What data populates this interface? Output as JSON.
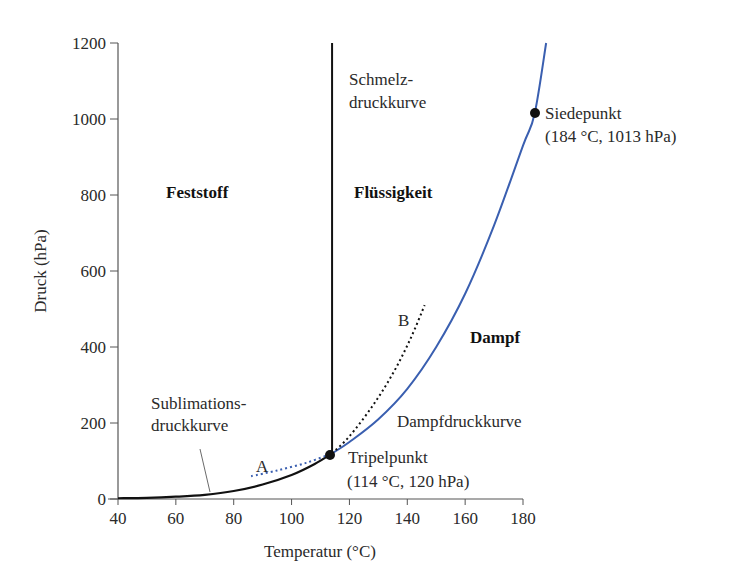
{
  "chart_data": {
    "type": "line",
    "title": "",
    "xlabel": "Temperatur (°C)",
    "ylabel": "Druck (hPa)",
    "xlim": [
      40,
      180
    ],
    "ylim": [
      0,
      1200
    ],
    "xticks": [
      40,
      60,
      80,
      100,
      120,
      140,
      160,
      180
    ],
    "yticks": [
      0,
      200,
      400,
      600,
      800,
      1000,
      1200
    ],
    "grid": false,
    "legend": null,
    "regions": {
      "solid": "Feststoff",
      "liquid": "Flüssigkeit",
      "vapor": "Dampf"
    },
    "series": [
      {
        "name": "Sublimationsdruckkurve",
        "style": "solid",
        "color": "#111111",
        "x": [
          40,
          50,
          60,
          70,
          80,
          90,
          100,
          108,
          114
        ],
        "y": [
          2,
          3,
          6,
          11,
          21,
          38,
          63,
          92,
          120
        ]
      },
      {
        "name": "Schmelzdruckkurve",
        "style": "solid",
        "color": "#111111",
        "x": [
          114,
          114
        ],
        "y": [
          120,
          1200
        ]
      },
      {
        "name": "Dampfdruckkurve",
        "style": "solid",
        "color": "#3a5fb0",
        "x": [
          114,
          120,
          130,
          140,
          150,
          160,
          170,
          180,
          184,
          188
        ],
        "y": [
          120,
          150,
          210,
          290,
          400,
          540,
          720,
          930,
          1013,
          1200
        ]
      },
      {
        "name": "A",
        "style": "dotted",
        "color": "#3a5fb0",
        "x": [
          86,
          95,
          105,
          114
        ],
        "y": [
          60,
          75,
          95,
          120
        ]
      },
      {
        "name": "B",
        "style": "dotted",
        "color": "#111111",
        "x": [
          114,
          120,
          128,
          135,
          141,
          146
        ],
        "y": [
          120,
          165,
          245,
          330,
          420,
          510
        ]
      }
    ],
    "points": [
      {
        "name": "Tripelpunkt",
        "label": "Tripelpunkt",
        "detail": "(114 °C, 120 hPa)",
        "x": 114,
        "y": 120
      },
      {
        "name": "Siedepunkt",
        "label": "Siedepunkt",
        "detail": "(184 °C, 1013 hPa)",
        "x": 184,
        "y": 1013
      }
    ],
    "annotations": [
      {
        "text": "Schmelz-",
        "line2": "druckkurve"
      },
      {
        "text": "Sublimations-",
        "line2": "druckkurve"
      },
      {
        "text": "Dampfdruckkurve"
      },
      {
        "text": "A"
      },
      {
        "text": "B"
      }
    ]
  },
  "labels": {
    "xlabel": "Temperatur (°C)",
    "ylabel": "Druck (hPa)",
    "feststoff": "Feststoff",
    "fluessigkeit": "Flüssigkeit",
    "dampf": "Dampf",
    "schmelz1": "Schmelz-",
    "schmelz2": "druckkurve",
    "sublim1": "Sublimations-",
    "sublim2": "druckkurve",
    "dampfdruck": "Dampfdruckkurve",
    "tripel": "Tripelpunkt",
    "tripel_detail": "(114 °C, 120 hPa)",
    "siede": "Siedepunkt",
    "siede_detail": "(184 °C, 1013 hPa)",
    "a": "A",
    "b": "B"
  }
}
